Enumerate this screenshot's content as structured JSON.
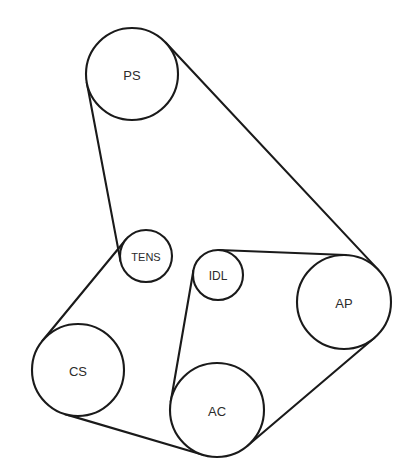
{
  "diagram": {
    "type": "belt-routing-schematic",
    "canvas": {
      "width": 405,
      "height": 472
    },
    "background_color": "#ffffff",
    "line_color": "#1a1a1a",
    "label_color": "#2b2b2b",
    "line_width": 2.1,
    "pulleys": [
      {
        "id": "ps",
        "label": "PS",
        "name": "power-steering-pulley",
        "cx": 132,
        "cy": 74,
        "r": 46,
        "font_size": 13
      },
      {
        "id": "tens",
        "label": "TENS",
        "name": "tensioner-pulley",
        "cx": 146,
        "cy": 256,
        "r": 26,
        "font_size": 11
      },
      {
        "id": "idl",
        "label": "IDL",
        "name": "idler-pulley",
        "cx": 218,
        "cy": 275,
        "r": 25,
        "font_size": 12
      },
      {
        "id": "ap",
        "label": "AP",
        "name": "alternator-pulley",
        "cx": 344,
        "cy": 302,
        "r": 47,
        "font_size": 13
      },
      {
        "id": "cs",
        "label": "CS",
        "name": "crankshaft-pulley",
        "cx": 78,
        "cy": 370,
        "r": 46,
        "font_size": 13
      },
      {
        "id": "ac",
        "label": "AC",
        "name": "air-conditioning-compressor-pulley",
        "cx": 217,
        "cy": 410,
        "r": 47,
        "font_size": 13
      }
    ],
    "belt_segments": [
      {
        "name": "belt-ps-to-ap",
        "from": "ps",
        "to": "ap",
        "side": "outer-upper"
      },
      {
        "name": "belt-ap-to-ac",
        "from": "ap",
        "to": "ac",
        "side": "outer-lower"
      },
      {
        "name": "belt-ac-to-cs",
        "from": "ac",
        "to": "cs",
        "side": "outer-bottom"
      },
      {
        "name": "belt-cs-to-tens",
        "from": "cs",
        "to": "tens",
        "side": "outer-upper"
      },
      {
        "name": "belt-tens-to-ps",
        "from": "tens",
        "to": "ps",
        "side": "outer-left"
      },
      {
        "name": "belt-idl-to-ac",
        "from": "idl",
        "to": "ac",
        "side": "inner-left"
      },
      {
        "name": "belt-idl-to-ap",
        "from": "idl",
        "to": "ap",
        "side": "inner-upper"
      }
    ]
  }
}
